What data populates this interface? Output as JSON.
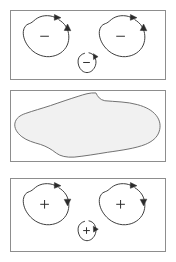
{
  "figure": {
    "title": "",
    "width": 176,
    "height": 262,
    "background_color": "#ffffff"
  },
  "style": {
    "panel_border_color": "#8d8d8d",
    "loop_stroke_color": "#3a3a3a",
    "sign_color": "#2b2b2b",
    "blob_fill_color": "#f1f1f1",
    "blob_stroke_color": "#6f6f6f",
    "ghost_text_color": "#f4f4f4"
  },
  "panels": [
    {
      "id": "top",
      "name": "negative-vorticity-panel",
      "label": "",
      "shapes": [
        {
          "name": "loop-large-left",
          "sign": "−",
          "circulation": "counterclockwise"
        },
        {
          "name": "loop-large-right",
          "sign": "−",
          "circulation": "counterclockwise"
        },
        {
          "name": "loop-small-center",
          "sign": "−",
          "circulation": "counterclockwise"
        }
      ]
    },
    {
      "id": "middle",
      "name": "merged-region-panel",
      "label": "",
      "shapes": [
        {
          "name": "blob-merged",
          "sign": "",
          "circulation": ""
        }
      ],
      "ghost_text_lines": [
        "",
        ""
      ]
    },
    {
      "id": "bottom",
      "name": "positive-vorticity-panel",
      "label": "",
      "shapes": [
        {
          "name": "loop-large-left",
          "sign": "+",
          "circulation": "clockwise"
        },
        {
          "name": "loop-large-right",
          "sign": "+",
          "circulation": "clockwise"
        },
        {
          "name": "loop-small-center",
          "sign": "+",
          "circulation": "clockwise"
        }
      ]
    }
  ]
}
